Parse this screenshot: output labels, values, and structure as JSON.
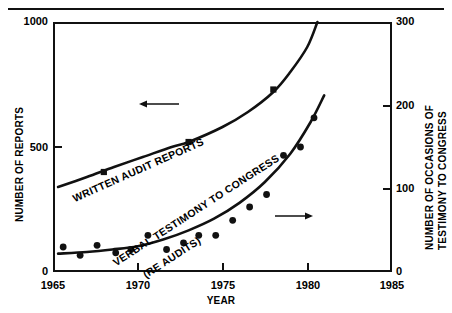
{
  "figure": {
    "has_top_rule": true,
    "background": "#ffffff",
    "ink": "#111111"
  },
  "chart_data": {
    "type": "line",
    "title": "",
    "subtitle": "",
    "xlabel": "YEAR",
    "ylabel": "NUMBER OF REPORTS",
    "y2label": "NUMBER OF OCCASIONS OF TESTIMONY TO CONGRESS",
    "xlim": [
      1965,
      1985
    ],
    "ylim": [
      0,
      1000
    ],
    "y2lim": [
      0,
      300
    ],
    "xticks": [
      1965,
      1970,
      1975,
      1980,
      1985
    ],
    "xticklabels": [
      "1965",
      "1970",
      "1975",
      "1980",
      "1985"
    ],
    "yticks": [
      0,
      500,
      1000
    ],
    "yticklabels": [
      "0",
      "500",
      "1000"
    ],
    "y2ticks": [
      0,
      100,
      200,
      300
    ],
    "y2ticklabels": [
      "0",
      "100",
      "200",
      "300"
    ],
    "grid": false,
    "legend": "inline-annotations",
    "series": [
      {
        "name": "WRITTEN AUDIT REPORTS",
        "axis": "left",
        "style": "smooth-curve-with-square-markers",
        "annotation_arrow": "left",
        "curve": [
          {
            "x": 1965.3,
            "y": 340
          },
          {
            "x": 1967.0,
            "y": 380
          },
          {
            "x": 1968.6,
            "y": 420
          },
          {
            "x": 1970.3,
            "y": 460
          },
          {
            "x": 1972.0,
            "y": 500
          },
          {
            "x": 1973.0,
            "y": 520
          },
          {
            "x": 1975.0,
            "y": 580
          },
          {
            "x": 1976.5,
            "y": 640
          },
          {
            "x": 1978.0,
            "y": 720
          },
          {
            "x": 1979.0,
            "y": 800
          },
          {
            "x": 1980.0,
            "y": 900
          },
          {
            "x": 1980.6,
            "y": 1000
          }
        ],
        "markers": [
          {
            "x": 1968.0,
            "y": 400
          },
          {
            "x": 1973.0,
            "y": 520
          },
          {
            "x": 1978.0,
            "y": 730
          }
        ]
      },
      {
        "name": "VERBAL TESTIMONY TO CONGRESS (RE AUDITS)",
        "axis": "right",
        "style": "smooth-curve-with-round-points",
        "annotation_arrow": "right",
        "curve": [
          {
            "x": 1965.3,
            "y": 22
          },
          {
            "x": 1967.0,
            "y": 24
          },
          {
            "x": 1968.5,
            "y": 27
          },
          {
            "x": 1970.0,
            "y": 31
          },
          {
            "x": 1971.5,
            "y": 39
          },
          {
            "x": 1973.0,
            "y": 50
          },
          {
            "x": 1974.5,
            "y": 64
          },
          {
            "x": 1976.0,
            "y": 83
          },
          {
            "x": 1977.5,
            "y": 108
          },
          {
            "x": 1979.0,
            "y": 142
          },
          {
            "x": 1980.2,
            "y": 180
          },
          {
            "x": 1981.0,
            "y": 212
          }
        ],
        "points": [
          {
            "x": 1965.6,
            "y": 30
          },
          {
            "x": 1966.6,
            "y": 20
          },
          {
            "x": 1967.6,
            "y": 32
          },
          {
            "x": 1968.7,
            "y": 23
          },
          {
            "x": 1969.6,
            "y": 27
          },
          {
            "x": 1970.6,
            "y": 44
          },
          {
            "x": 1971.7,
            "y": 27
          },
          {
            "x": 1972.7,
            "y": 35
          },
          {
            "x": 1973.6,
            "y": 44
          },
          {
            "x": 1974.6,
            "y": 44
          },
          {
            "x": 1975.6,
            "y": 62
          },
          {
            "x": 1976.6,
            "y": 78
          },
          {
            "x": 1977.6,
            "y": 93
          },
          {
            "x": 1978.6,
            "y": 140
          },
          {
            "x": 1979.6,
            "y": 150
          },
          {
            "x": 1980.4,
            "y": 185
          }
        ]
      }
    ]
  },
  "labels": {
    "series1": "WRITTEN AUDIT REPORTS",
    "series2_line1": "VERBAL TESTIMONY TO CONGRESS",
    "series2_line2": "(RE AUDITS)",
    "xaxis": "YEAR",
    "yaxis_left": "NUMBER OF REPORTS",
    "yaxis_right_line1": "NUMBER OF OCCASIONS OF",
    "yaxis_right_line2": "TESTIMONY TO CONGRESS",
    "y_0": "0",
    "y_500": "500",
    "y_1000": "1000",
    "y2_0": "0",
    "y2_100": "100",
    "y2_200": "200",
    "y2_300": "300",
    "x_1965": "1965",
    "x_1970": "1970",
    "x_1975": "1975",
    "x_1980": "1980",
    "x_1985": "1985"
  }
}
